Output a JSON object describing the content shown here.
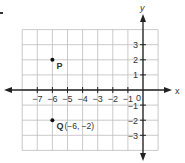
{
  "chart_data": {
    "type": "scatter",
    "title": "",
    "xlabel": "x",
    "ylabel": "y",
    "xlim": [
      -8,
      1
    ],
    "ylim": [
      -4,
      4
    ],
    "grid": true,
    "x_ticks": [
      -7,
      -6,
      -5,
      -4,
      -3,
      -2,
      -1
    ],
    "y_ticks": [
      3,
      2,
      1,
      -1,
      -2,
      -3
    ],
    "origin_label": "0",
    "points": [
      {
        "name": "P",
        "x": -6,
        "y": 2,
        "label": "P"
      },
      {
        "name": "Q",
        "x": -6,
        "y": -2,
        "label": "Q",
        "annotation": "(−6, −2)"
      }
    ]
  },
  "colors": {
    "grid": "#bdbdbd",
    "axis": "#222222",
    "text": "#333333",
    "point": "#111111"
  }
}
